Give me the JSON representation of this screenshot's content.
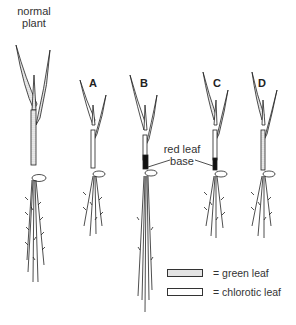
{
  "labels": {
    "normal_plant": "normal\nplant",
    "normal_plant_line1": "normal",
    "normal_plant_line2": "plant",
    "plant_a": "A",
    "plant_b": "B",
    "plant_c": "C",
    "plant_d": "D",
    "red_leaf_base_line1": "red leaf",
    "red_leaf_base_line2": "base"
  },
  "legend": {
    "items": [
      {
        "swatch": "dotted",
        "label": "= green leaf"
      },
      {
        "swatch": "blank",
        "label": "= chlorotic leaf"
      }
    ]
  }
}
